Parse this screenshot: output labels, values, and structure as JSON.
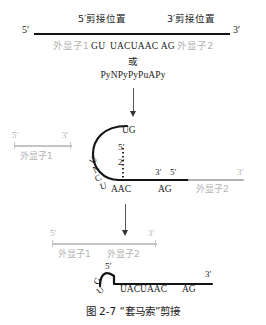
{
  "figure": {
    "caption_number": "图 2-7",
    "caption_title": "“套马索”剪接",
    "caption_full": "图 2-7  “套马索”剪接"
  },
  "stage_pre_mrna": {
    "splice_site_5_label": "5′剪接位置",
    "splice_site_3_label": "3′剪接位置",
    "end_5_label": "5′",
    "end_3_label": "3′",
    "exon1_label": "外显子1",
    "exon2_label": "外显子2",
    "donor_seq": "GU",
    "branch_seq": "UACUAAC",
    "acceptor_seq": "AG",
    "alternative_label": "或",
    "consensus_seq": "PyNPyPyPuAPy"
  },
  "stage_lariat": {
    "free_exon1_label": "外显子1",
    "free_exon1_end_5": "5′",
    "free_exon1_end_3": "3′",
    "loop_top_seq": "UG",
    "loop_side_seq": "UACU",
    "branch_point_5": "5′",
    "branch_point_2": "2′",
    "branch_seq": "AAC",
    "acceptor_seq": "AG",
    "intron_end_3": "3′",
    "exon2_end_5": "5′",
    "exon2_label": "外显子2",
    "exon2_end_3": "3′"
  },
  "stage_products": {
    "ligated_end_5": "5′",
    "ligated_end_3": "3′",
    "ligated_exon1_label": "外显子1",
    "ligated_exon2_label": "外显子2",
    "intron_end_5": "5′",
    "intron_donor_seq": "GU",
    "intron_branch_seq": "UACUAAC",
    "intron_acceptor_seq": "AG",
    "intron_end_3": "3′"
  },
  "colors": {
    "ink": "#141414",
    "exon_gray": "#b3b3b3",
    "arrow": "#333333",
    "background": "#ffffff"
  }
}
